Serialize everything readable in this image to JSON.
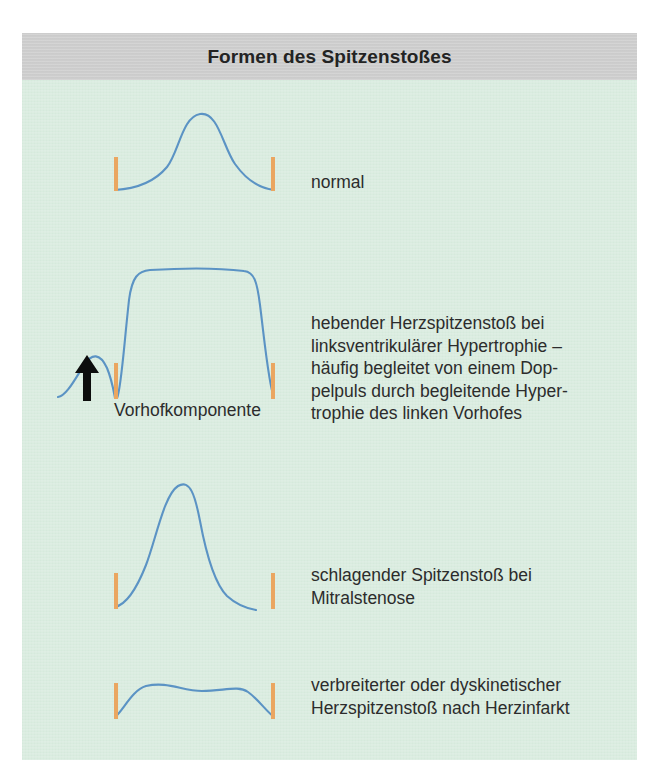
{
  "figure": {
    "title": "Formen des Spitzenstoßes",
    "background_color": "#d9ecdf",
    "title_band_color": "#cdcdcd",
    "curve_color": "#5b93c4",
    "tick_color": "#eaa661",
    "arrow_color": "#0d0d0d",
    "text_color": "#2c2c2c"
  },
  "rows": [
    {
      "id": "normal",
      "label": "normal",
      "waveform": "smooth symmetric bell",
      "marker_count": 2
    },
    {
      "id": "hypertrophie",
      "label": "hebender Herzspitzenstoß bei\nlinksventrikulärer Hypertrophie –\nhäufig begleitet von einem Dop-\npelpuls durch begleitende Hyper-\ntrophie des linken Vorhofes",
      "waveform": "tall sustained plateau with preceding atrial wave",
      "marker_count": 2,
      "annotation": "Vorhofkomponente",
      "annotation_arrow": "up-arrow"
    },
    {
      "id": "mitralstenose",
      "label": "schlagender Spitzenstoß bei\nMitralstenose",
      "waveform": "sharp tall asymmetric peak with early decline",
      "marker_count": 2
    },
    {
      "id": "herzinfarkt",
      "label": "verbreiterter oder dyskinetischer\nHerzspitzenstoß nach Herzinfarkt",
      "waveform": "low broad flattened dome",
      "marker_count": 2
    }
  ]
}
